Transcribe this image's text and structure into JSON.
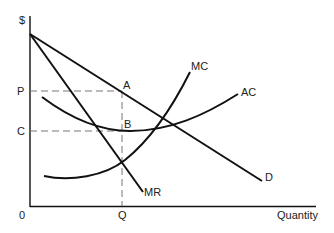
{
  "diagram": {
    "axes": {
      "y_label": "$",
      "x_label": "Quantity",
      "origin_label": "0"
    },
    "levels": {
      "price_label": "P",
      "cost_label": "C",
      "quantity_label": "Q"
    },
    "points": {
      "a_label": "A",
      "b_label": "B"
    },
    "curves": {
      "demand_label": "D",
      "marginal_revenue_label": "MR",
      "marginal_cost_label": "MC",
      "average_cost_label": "AC"
    },
    "colors": {
      "line": "#111111",
      "dashed": "#777777"
    }
  }
}
